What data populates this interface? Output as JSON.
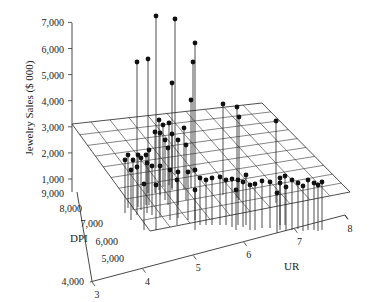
{
  "chart_data": {
    "type": "scatter3d",
    "title": "",
    "zlabel": "Jewelry Sales ($ 000)",
    "xlabel": "UR",
    "ylabel": "DPI",
    "z_ticks": [
      "1,000",
      "2,000",
      "3,000",
      "4,000",
      "5,000",
      "6,000",
      "7,000"
    ],
    "y_ticks": [
      "4,000",
      "5,000",
      "6,000",
      "7,000",
      "8,000",
      "9,000"
    ],
    "x_ticks": [
      "3",
      "4",
      "5",
      "6",
      "7",
      "8"
    ],
    "zlim": [
      0,
      7000
    ],
    "ylim": [
      4000,
      9000
    ],
    "xlim": [
      3,
      8
    ],
    "regression_plane": true,
    "grid_on_plane": "10x10",
    "drop_lines": true,
    "points_screen_px": [
      [
        137,
        62,
        145
      ],
      [
        156,
        16,
        143
      ],
      [
        175,
        19,
        150
      ],
      [
        195,
        43,
        145
      ],
      [
        193,
        62,
        148
      ],
      [
        148,
        59,
        168
      ],
      [
        172,
        83,
        165
      ],
      [
        191,
        100,
        163
      ],
      [
        223,
        104,
        170
      ],
      [
        237,
        107,
        173
      ],
      [
        239,
        117,
        175
      ],
      [
        276,
        121,
        178
      ],
      [
        159,
        120,
        165
      ],
      [
        163,
        125,
        162
      ],
      [
        169,
        123,
        160
      ],
      [
        172,
        134,
        163
      ],
      [
        160,
        133,
        170
      ],
      [
        155,
        132,
        168
      ],
      [
        165,
        140,
        175
      ],
      [
        168,
        148,
        180
      ],
      [
        178,
        140,
        180
      ],
      [
        184,
        128,
        165
      ],
      [
        186,
        145,
        175
      ],
      [
        149,
        150,
        180
      ],
      [
        146,
        155,
        180
      ],
      [
        141,
        158,
        185
      ],
      [
        138,
        155,
        182
      ],
      [
        133,
        160,
        185
      ],
      [
        128,
        155,
        183
      ],
      [
        125,
        160,
        188
      ],
      [
        137,
        167,
        190
      ],
      [
        147,
        163,
        188
      ],
      [
        152,
        166,
        190
      ],
      [
        160,
        166,
        192
      ],
      [
        170,
        170,
        195
      ],
      [
        178,
        172,
        193
      ],
      [
        188,
        172,
        195
      ],
      [
        195,
        170,
        195
      ],
      [
        200,
        178,
        200
      ],
      [
        206,
        180,
        200
      ],
      [
        212,
        178,
        200
      ],
      [
        220,
        177,
        200
      ],
      [
        226,
        180,
        200
      ],
      [
        232,
        179,
        202
      ],
      [
        238,
        180,
        200
      ],
      [
        243,
        182,
        202
      ],
      [
        246,
        175,
        200
      ],
      [
        250,
        185,
        205
      ],
      [
        255,
        184,
        205
      ],
      [
        262,
        181,
        203
      ],
      [
        270,
        182,
        203
      ],
      [
        280,
        183,
        205
      ],
      [
        286,
        187,
        206
      ],
      [
        292,
        180,
        205
      ],
      [
        298,
        183,
        204
      ],
      [
        303,
        186,
        206
      ],
      [
        308,
        180,
        205
      ],
      [
        314,
        183,
        205
      ],
      [
        318,
        185,
        206
      ],
      [
        322,
        182,
        205
      ],
      [
        280,
        178,
        200
      ],
      [
        285,
        176,
        200
      ],
      [
        277,
        193,
        208
      ],
      [
        236,
        190,
        205
      ],
      [
        195,
        190,
        205
      ],
      [
        177,
        180,
        200
      ],
      [
        156,
        185,
        205
      ],
      [
        144,
        184,
        205
      ],
      [
        131,
        170,
        195
      ]
    ]
  },
  "axes": {
    "z_label": "Jewelry Sales ($ 000)",
    "dpi_label": "DPI",
    "ur_label": "UR"
  }
}
